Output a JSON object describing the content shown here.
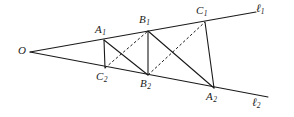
{
  "figure": {
    "type": "geometry-diagram",
    "width": 294,
    "height": 117,
    "background_color": "#ffffff",
    "stroke_color": "#1a1a1a",
    "labels": {
      "vertex_o": "O",
      "a1_base": "A",
      "a1_sub": "1",
      "b1_base": "B",
      "b1_sub": "1",
      "c1_base": "C",
      "c1_sub": "1",
      "c2_base": "C",
      "c2_sub": "2",
      "b2_base": "B",
      "b2_sub": "2",
      "a2_base": "A",
      "a2_sub": "2",
      "line1_base": "ℓ",
      "line1_sub": "1",
      "line2_base": "ℓ",
      "line2_sub": "2"
    },
    "points": {
      "O": {
        "x": 30,
        "y": 52
      },
      "A1": {
        "x": 104,
        "y": 40
      },
      "B1": {
        "x": 148,
        "y": 31
      },
      "C1": {
        "x": 205,
        "y": 22
      },
      "C2": {
        "x": 105,
        "y": 68
      },
      "B2": {
        "x": 148,
        "y": 75
      },
      "A2": {
        "x": 214,
        "y": 88
      },
      "L1_end": {
        "x": 256,
        "y": 12
      },
      "L2_end": {
        "x": 268,
        "y": 97
      }
    },
    "label_positions": {
      "O": {
        "x": 18,
        "y": 45
      },
      "A1": {
        "x": 95,
        "y": 24
      },
      "B1": {
        "x": 139,
        "y": 14
      },
      "C1": {
        "x": 196,
        "y": 5
      },
      "C2": {
        "x": 96,
        "y": 71
      },
      "B2": {
        "x": 140,
        "y": 78
      },
      "A2": {
        "x": 206,
        "y": 91
      },
      "L1": {
        "x": 256,
        "y": 3
      },
      "L2": {
        "x": 252,
        "y": 97
      }
    },
    "rays": [
      {
        "name": "ray-ell-1",
        "from": "O",
        "to": "L1_end",
        "style": "solid"
      },
      {
        "name": "ray-ell-2",
        "from": "O",
        "to": "L2_end",
        "style": "solid"
      }
    ],
    "segments": [
      {
        "name": "segment-a1-c2",
        "from": "A1",
        "to": "C2",
        "style": "solid"
      },
      {
        "name": "segment-a1-b2",
        "from": "A1",
        "to": "B2",
        "style": "solid"
      },
      {
        "name": "segment-b1-b2",
        "from": "B1",
        "to": "B2",
        "style": "solid"
      },
      {
        "name": "segment-b1-a2",
        "from": "B1",
        "to": "A2",
        "style": "solid"
      },
      {
        "name": "segment-c1-a2",
        "from": "C1",
        "to": "A2",
        "style": "solid"
      },
      {
        "name": "segment-c2-b1",
        "from": "C2",
        "to": "B1",
        "style": "dashed"
      },
      {
        "name": "segment-b2-c1",
        "from": "B2",
        "to": "C1",
        "style": "dashed"
      }
    ]
  }
}
